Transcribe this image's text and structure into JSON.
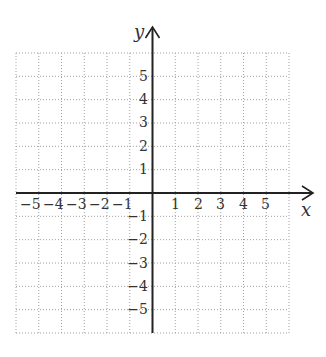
{
  "chart_data": {
    "type": "coordinate-grid",
    "title": "",
    "xlabel": "x",
    "ylabel": "y",
    "xlim": [
      -6,
      6
    ],
    "ylim": [
      -6,
      6
    ],
    "grid": true,
    "grid_style": "dotted",
    "x_ticks": [
      "-5",
      "-4",
      "-3",
      "-2",
      "-1",
      "1",
      "2",
      "3",
      "4",
      "5"
    ],
    "y_ticks": [
      "5",
      "4",
      "3",
      "2",
      "1",
      "-1",
      "-2",
      "-3",
      "-4",
      "-5"
    ],
    "points": []
  },
  "labels": {
    "x_axis": "x",
    "y_axis": "y",
    "x_neg": [
      "−5",
      "−4",
      "−3",
      "−2",
      "−1"
    ],
    "x_pos": [
      "1",
      "2",
      "3",
      "4",
      "5"
    ],
    "y_pos": [
      "5",
      "4",
      "3",
      "2",
      "1"
    ],
    "y_neg": [
      "−1",
      "−2",
      "−3",
      "−4",
      "−5"
    ]
  },
  "colors": {
    "axis": "#222222",
    "grid": "#9a9a9a",
    "text": "#333333"
  }
}
